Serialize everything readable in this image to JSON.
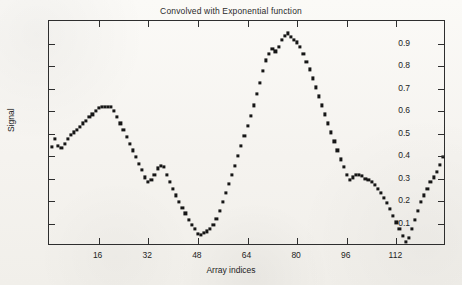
{
  "chart_data": {
    "type": "scatter",
    "title": "Convolved with Exponential function",
    "xlabel": "Array indices",
    "ylabel": "Signal",
    "xlim": [
      0,
      128
    ],
    "ylim": [
      0.0,
      1.0
    ],
    "grid": false,
    "legend": null,
    "marker": "square",
    "marker_color": "#161616",
    "xticks": [
      16,
      32,
      48,
      64,
      80,
      96,
      112
    ],
    "xticklabels": [
      "16",
      "32",
      "48",
      "64",
      "80",
      "96",
      "112"
    ],
    "yticks": [
      0.1,
      0.2,
      0.3,
      0.4,
      0.5,
      0.6,
      0.7,
      0.8,
      0.9
    ],
    "yticklabels": [
      "0.1",
      "0.2",
      "0.3",
      "0.4",
      "0.5",
      "0.6",
      "0.7",
      "0.8",
      "0.9"
    ],
    "x": [
      1,
      2,
      3,
      4,
      5,
      6,
      7,
      8,
      9,
      10,
      11,
      12,
      13,
      14,
      15,
      16,
      17,
      18,
      19,
      20,
      21,
      22,
      23,
      24,
      25,
      26,
      27,
      28,
      29,
      30,
      31,
      32,
      33,
      34,
      35,
      36,
      37,
      38,
      39,
      40,
      41,
      42,
      43,
      44,
      45,
      46,
      47,
      48,
      49,
      50,
      51,
      52,
      53,
      54,
      55,
      56,
      57,
      58,
      59,
      60,
      61,
      62,
      63,
      64,
      65,
      66,
      67,
      68,
      69,
      70,
      71,
      72,
      73,
      74,
      75,
      76,
      77,
      78,
      79,
      80,
      81,
      82,
      83,
      84,
      85,
      86,
      87,
      88,
      89,
      90,
      91,
      92,
      93,
      94,
      95,
      96,
      97,
      98,
      99,
      100,
      101,
      102,
      103,
      104,
      105,
      106,
      107,
      108,
      109,
      110,
      111,
      112,
      113,
      114,
      115,
      116,
      117,
      118,
      119,
      120,
      121,
      122,
      123,
      124,
      125,
      126,
      127
    ],
    "values": [
      0.44,
      0.475,
      0.445,
      0.435,
      0.455,
      0.475,
      0.495,
      0.505,
      0.515,
      0.53,
      0.545,
      0.555,
      0.575,
      0.585,
      0.6,
      0.615,
      0.62,
      0.62,
      0.62,
      0.62,
      0.6,
      0.575,
      0.545,
      0.515,
      0.485,
      0.455,
      0.425,
      0.395,
      0.365,
      0.34,
      0.305,
      0.285,
      0.295,
      0.315,
      0.345,
      0.355,
      0.35,
      0.315,
      0.285,
      0.255,
      0.225,
      0.195,
      0.17,
      0.145,
      0.115,
      0.095,
      0.075,
      0.055,
      0.05,
      0.06,
      0.065,
      0.075,
      0.095,
      0.12,
      0.155,
      0.195,
      0.235,
      0.275,
      0.315,
      0.355,
      0.4,
      0.445,
      0.49,
      0.535,
      0.58,
      0.625,
      0.675,
      0.725,
      0.78,
      0.825,
      0.855,
      0.875,
      0.865,
      0.885,
      0.915,
      0.935,
      0.945,
      0.93,
      0.915,
      0.905,
      0.885,
      0.855,
      0.82,
      0.785,
      0.745,
      0.705,
      0.665,
      0.625,
      0.585,
      0.545,
      0.505,
      0.465,
      0.425,
      0.385,
      0.35,
      0.315,
      0.295,
      0.305,
      0.315,
      0.315,
      0.31,
      0.3,
      0.295,
      0.285,
      0.27,
      0.255,
      0.235,
      0.215,
      0.19,
      0.165,
      0.135,
      0.105,
      0.075,
      0.045,
      0.02,
      0.035,
      0.075,
      0.115,
      0.155,
      0.195,
      0.225,
      0.255,
      0.285,
      0.305,
      0.33,
      0.36,
      0.395
    ]
  }
}
